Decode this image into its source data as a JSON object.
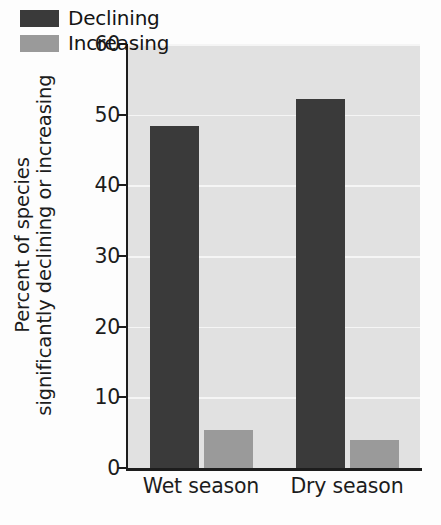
{
  "chart_data": {
    "type": "bar",
    "title": "",
    "subtitle": "",
    "xlabel": "",
    "ylabel_line1": "Percent of species",
    "ylabel_line2": "significantly declining or increasing",
    "categories": [
      "Wet season",
      "Dry season"
    ],
    "series": [
      {
        "name": "Declining",
        "values": [
          48.4,
          52.2
        ],
        "color": "#3a3a3a"
      },
      {
        "name": "Increasing",
        "values": [
          5.4,
          4.0
        ],
        "color": "#9a9a9a"
      }
    ],
    "ylim": [
      0,
      60
    ],
    "yticks": [
      0,
      10,
      20,
      30,
      40,
      50,
      60
    ],
    "ytick_labels": [
      "0",
      "10",
      "20",
      "30",
      "40",
      "50",
      "60"
    ],
    "grid": true,
    "grid_color": "#f5f5f5",
    "grid_axis": "y",
    "legend_position": "top-left",
    "plot_background": "#e1e1e1",
    "figure_background": "#fdfdfd",
    "axis_color": "#1d1d1d",
    "text_color": "#1c1c1c"
  }
}
